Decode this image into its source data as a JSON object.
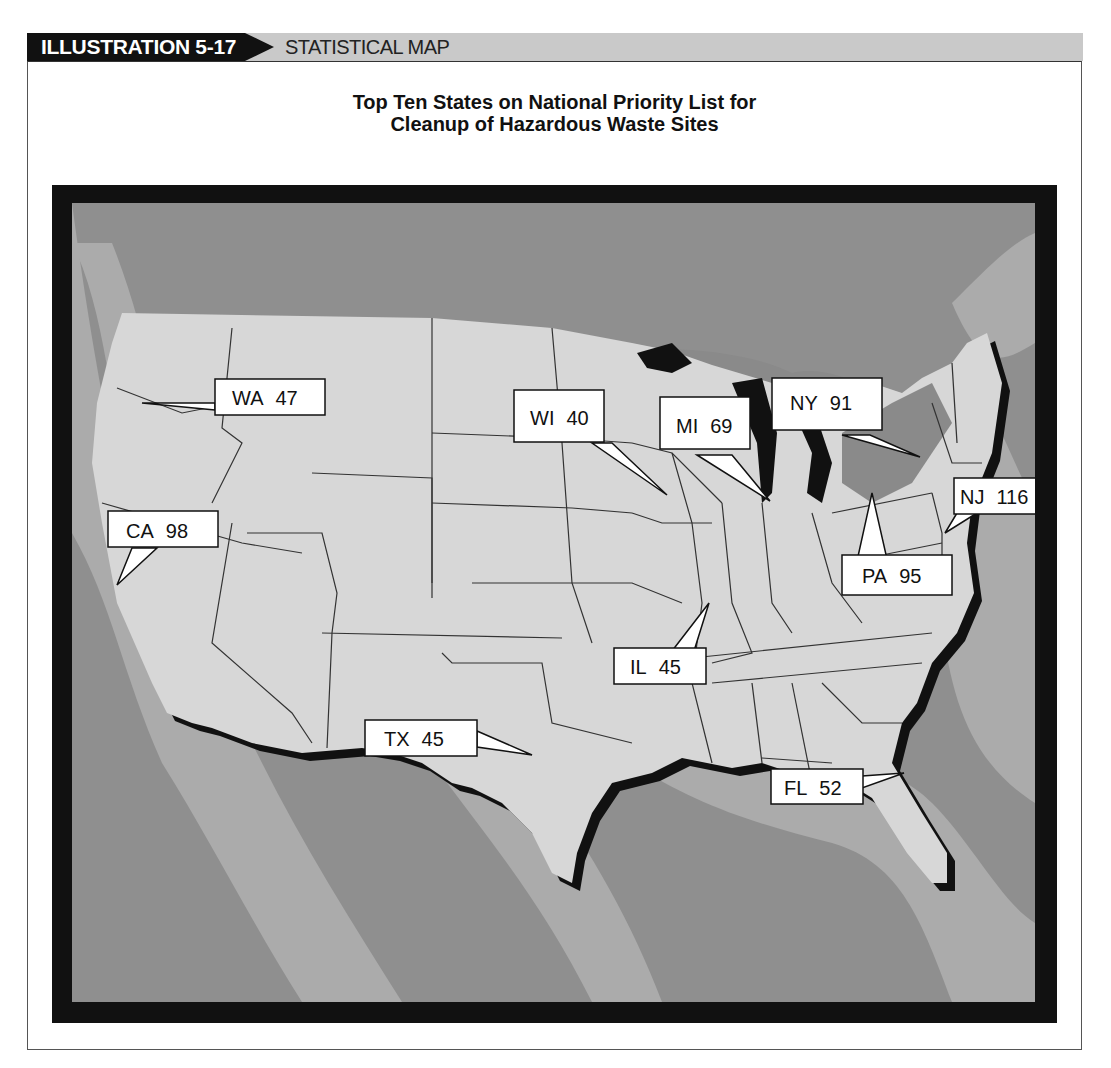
{
  "header": {
    "tag": "ILLUSTRATION 5-17",
    "subtitle": "STATISTICAL MAP"
  },
  "title": {
    "line1": "Top Ten States on National Priority List for",
    "line2": "Cleanup of Hazardous Waste Sites"
  },
  "colors": {
    "sea_dark": "#8f8f8f",
    "sea_light": "#ababab",
    "land": "#d7d7d7",
    "frame": "#111111",
    "callout_fill": "#ffffff"
  },
  "map": {
    "subject": "United States (contiguous)",
    "metric": "Hazardous waste sites on National Priority List",
    "states": [
      {
        "abbr": "WA",
        "value": 47
      },
      {
        "abbr": "WI",
        "value": 40
      },
      {
        "abbr": "MI",
        "value": 69
      },
      {
        "abbr": "NY",
        "value": 91
      },
      {
        "abbr": "NJ",
        "value": 116
      },
      {
        "abbr": "CA",
        "value": 98
      },
      {
        "abbr": "PA",
        "value": 95
      },
      {
        "abbr": "IL",
        "value": 45
      },
      {
        "abbr": "TX",
        "value": 45
      },
      {
        "abbr": "FL",
        "value": 52
      }
    ]
  }
}
